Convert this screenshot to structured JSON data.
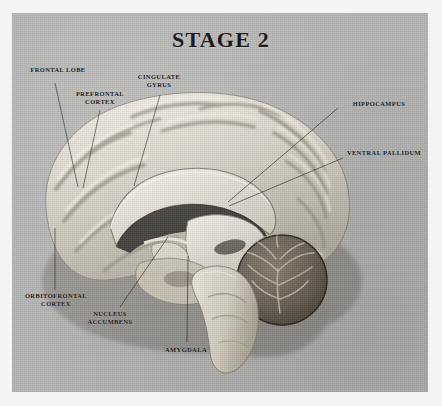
{
  "figure": {
    "title": "STAGE 2",
    "background_color": "#b5b5b4",
    "page_color": "#f4f4f4",
    "text_color": "#181818",
    "leader_line_color": "#2a2a2a"
  },
  "labels": [
    {
      "id": "frontal-lobe",
      "text": "FRONTAL LOBE",
      "x": 22,
      "y": 66,
      "w": 72,
      "line": [
        55,
        83,
        78,
        187
      ]
    },
    {
      "id": "prefrontal-cortex",
      "text": "PREFRONTAL\nCORTEX",
      "x": 64,
      "y": 90,
      "w": 72,
      "line": [
        100,
        110,
        83,
        188
      ]
    },
    {
      "id": "cingulate-gyrus",
      "text": "CINGULATE\nGYRUS",
      "x": 126,
      "y": 73,
      "w": 66,
      "line": [
        160,
        95,
        134,
        186
      ]
    },
    {
      "id": "hippocampus",
      "text": "HIPPOCAMPUS",
      "x": 340,
      "y": 100,
      "w": 78,
      "line": [
        338,
        108,
        228,
        202
      ]
    },
    {
      "id": "ventral-pallidum",
      "text": "VENTRAL PALLIDUM",
      "x": 338,
      "y": 149,
      "w": 92,
      "line": [
        343,
        158,
        229,
        206
      ]
    },
    {
      "id": "orbitofrontal-cortex",
      "text": "ORBITOFRONTAL\nCORTEX",
      "x": 12,
      "y": 292,
      "w": 88,
      "line": [
        55,
        228,
        55,
        290
      ]
    },
    {
      "id": "nucleus-accumbens",
      "text": "NUCLEUS\nACCUMBENS",
      "x": 72,
      "y": 310,
      "w": 76,
      "line": [
        168,
        237,
        120,
        307
      ]
    },
    {
      "id": "amygdala",
      "text": "AMYGDALA",
      "x": 148,
      "y": 346,
      "w": 76,
      "line": [
        188,
        256,
        187,
        342
      ]
    }
  ]
}
